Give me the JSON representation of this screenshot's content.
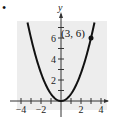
{
  "marker": "•",
  "chart_data": {
    "type": "line",
    "title": "",
    "function": "y = (2/3)x^2",
    "xlabel": "",
    "ylabel": "y",
    "xlim": [
      -4.5,
      4.5
    ],
    "ylim": [
      -1,
      7.8
    ],
    "x_ticks": [
      -4,
      -3,
      -2,
      -1,
      1,
      2,
      3,
      4
    ],
    "x_tick_labels": [
      "-4",
      "-2",
      "2",
      "4"
    ],
    "y_ticks": [
      1,
      2,
      3,
      4,
      5,
      6,
      7
    ],
    "y_tick_labels": [
      "2",
      "4",
      "6"
    ],
    "grid": false,
    "background": "#eeeeee",
    "series": [
      {
        "name": "parabola",
        "x": [
          -3.35,
          -3,
          -2,
          -1,
          0,
          1,
          2,
          3,
          3.35
        ],
        "values": [
          7.48,
          6,
          2.67,
          0.67,
          0,
          0.67,
          2.67,
          6,
          7.48
        ],
        "color": "#111111"
      }
    ],
    "annotations": [
      {
        "x": 3,
        "y": 6,
        "label": "(3, 6)",
        "marker": "filled-circle"
      }
    ]
  }
}
